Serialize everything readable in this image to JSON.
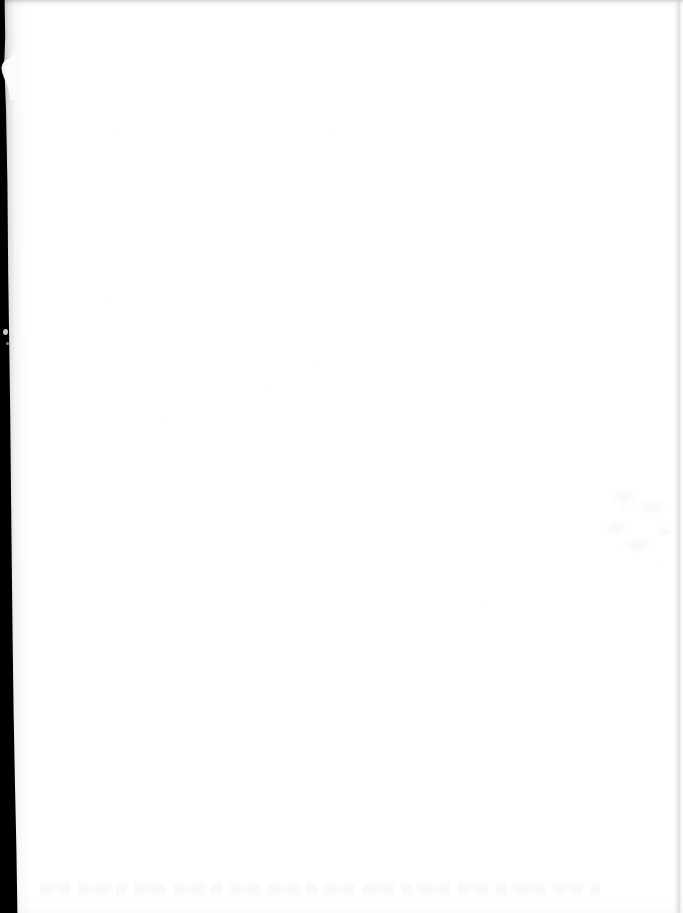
{
  "document": {
    "kind": "scanned-page",
    "content_state": "blank",
    "visible_text": "",
    "caption": ""
  },
  "page": {
    "width_px": 683,
    "height_px": 913,
    "paper_color": "#ffffff",
    "background_color": "#ffffff"
  },
  "artifacts": {
    "left_gutter": {
      "name": "binding-gutter-shadow",
      "color": "#000000",
      "edge": "left",
      "width_top_px": 4,
      "width_bottom_px": 17
    },
    "torn_sliver": {
      "name": "torn-edge-sliver",
      "color": "#fbfbfb",
      "top_px": 54,
      "height_px": 46
    },
    "gutter_speck": {
      "name": "paper-speck",
      "color": "#e8e8e8",
      "top_px": 329
    },
    "top_edge": {
      "name": "top-edge-shadow",
      "color": "#b2b4b8",
      "height_px": 9
    },
    "right_edge": {
      "name": "right-edge-line",
      "color": "#c4c6ca",
      "left_px": 674
    },
    "bleed_smudge_right": {
      "name": "bleed-through-smudge",
      "color": "#6d7075",
      "left_px": 596,
      "top_px": 478
    },
    "bleed_band_bottom": {
      "name": "bleed-through-text-band",
      "color": "#5a5c60",
      "top_px": 880
    },
    "bottom_edge": {
      "name": "bottom-edge-shadow",
      "color": "#f6f6f8",
      "height_px": 22
    }
  },
  "dust_specks": [
    {
      "left_px": 114,
      "top_px": 131,
      "size_px": 2
    },
    {
      "left_px": 332,
      "top_px": 131,
      "size_px": 2
    },
    {
      "left_px": 105,
      "top_px": 298,
      "size_px": 2
    },
    {
      "left_px": 313,
      "top_px": 363,
      "size_px": 2
    },
    {
      "left_px": 267,
      "top_px": 387,
      "size_px": 2
    },
    {
      "left_px": 164,
      "top_px": 420,
      "size_px": 2
    },
    {
      "left_px": 483,
      "top_px": 604,
      "size_px": 2
    },
    {
      "left_px": 646,
      "top_px": 535,
      "size_px": 3
    },
    {
      "left_px": 621,
      "top_px": 509,
      "size_px": 3
    },
    {
      "left_px": 659,
      "top_px": 562,
      "size_px": 2
    }
  ]
}
